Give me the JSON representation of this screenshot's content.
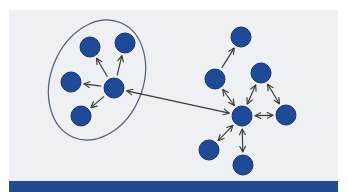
{
  "diagram": {
    "title": "",
    "colors": {
      "background": "#eef0f3",
      "node_fill": "#1f4a98",
      "node_stroke": "#12336e",
      "edge": "#3a3a3a",
      "ellipse": "#4a5a80",
      "bottom_bar": "#23498f"
    },
    "groups": [
      {
        "id": "left-cluster",
        "shape": "ellipse",
        "enclosed": true,
        "center": [
          97,
          80
        ],
        "rx": 46,
        "ry": 62,
        "rotation": 22
      }
    ],
    "nodes": [
      {
        "id": "L1",
        "group": "left-cluster",
        "x": 90,
        "y": 47
      },
      {
        "id": "L2",
        "group": "left-cluster",
        "x": 125,
        "y": 43
      },
      {
        "id": "L3",
        "group": "left-cluster",
        "x": 71,
        "y": 82
      },
      {
        "id": "L4",
        "group": "left-cluster",
        "x": 114,
        "y": 88
      },
      {
        "id": "L5",
        "group": "left-cluster",
        "x": 81,
        "y": 116
      },
      {
        "id": "R1",
        "group": "right-cluster",
        "x": 241,
        "y": 37
      },
      {
        "id": "R2",
        "group": "right-cluster",
        "x": 215,
        "y": 79
      },
      {
        "id": "R3",
        "group": "right-cluster",
        "x": 261,
        "y": 73
      },
      {
        "id": "R4",
        "group": "right-cluster",
        "x": 242,
        "y": 116
      },
      {
        "id": "R5",
        "group": "right-cluster",
        "x": 286,
        "y": 115
      },
      {
        "id": "R6",
        "group": "right-cluster",
        "x": 209,
        "y": 150
      },
      {
        "id": "R7",
        "group": "right-cluster",
        "x": 243,
        "y": 165
      }
    ],
    "edges": [
      {
        "from": "L4",
        "to": "L1",
        "direction": "forward"
      },
      {
        "from": "L4",
        "to": "L2",
        "direction": "forward"
      },
      {
        "from": "L4",
        "to": "L3",
        "direction": "forward"
      },
      {
        "from": "L4",
        "to": "L5",
        "direction": "forward"
      },
      {
        "from": "L4",
        "to": "R4",
        "direction": "both"
      },
      {
        "from": "R2",
        "to": "R1",
        "direction": "forward"
      },
      {
        "from": "R4",
        "to": "R2",
        "direction": "both"
      },
      {
        "from": "R4",
        "to": "R3",
        "direction": "both"
      },
      {
        "from": "R3",
        "to": "R5",
        "direction": "both"
      },
      {
        "from": "R4",
        "to": "R5",
        "direction": "both"
      },
      {
        "from": "R4",
        "to": "R6",
        "direction": "both"
      },
      {
        "from": "R4",
        "to": "R7",
        "direction": "both"
      }
    ],
    "node_radius": 10
  }
}
